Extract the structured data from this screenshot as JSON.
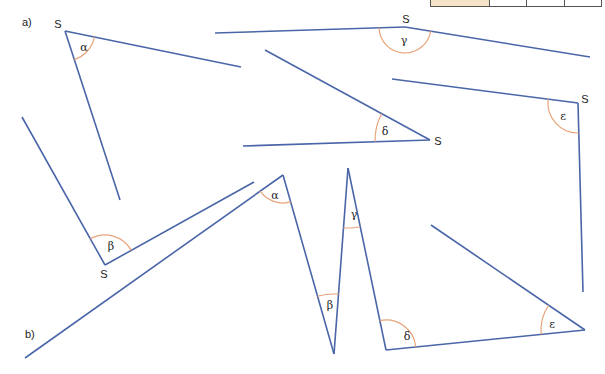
{
  "colors": {
    "line": "#4a66a8",
    "arc": "#e8a37a",
    "text": "#222222"
  },
  "top_table": {
    "cells": 4
  },
  "section_a": {
    "label": "a)",
    "angles": [
      {
        "name": "alpha",
        "symbol": "α",
        "vertex_label": "S",
        "vertex": [
          65,
          31
        ],
        "arm1": [
          241,
          67
        ],
        "arm2": [
          120,
          200
        ],
        "arc_r": 30,
        "symbol_pos": [
          84,
          47
        ],
        "vertex_label_pos": [
          58,
          24
        ]
      },
      {
        "name": "beta",
        "symbol": "β",
        "vertex_label": "S",
        "vertex": [
          105,
          265
        ],
        "arm1": [
          22,
          117
        ],
        "arm2": [
          254,
          182
        ],
        "arc_r": 30,
        "symbol_pos": [
          111,
          246
        ],
        "vertex_label_pos": [
          104,
          274
        ]
      },
      {
        "name": "gamma",
        "symbol": "γ",
        "vertex_label": "S",
        "vertex": [
          405,
          27
        ],
        "arm1": [
          215,
          33
        ],
        "arm2": [
          590,
          57
        ],
        "arc_r": 26,
        "symbol_pos": [
          404,
          40
        ],
        "vertex_label_pos": [
          406,
          19
        ]
      },
      {
        "name": "delta",
        "symbol": "δ",
        "vertex_label": "S",
        "vertex": [
          430,
          140
        ],
        "arm1": [
          265,
          50
        ],
        "arm2": [
          243,
          146
        ],
        "arc_r": 55,
        "symbol_pos": [
          385,
          131
        ],
        "vertex_label_pos": [
          438,
          141
        ]
      },
      {
        "name": "epsilon",
        "symbol": "ε",
        "vertex_label": "S",
        "vertex": [
          578,
          103
        ],
        "arm1": [
          392,
          79
        ],
        "arm2": [
          583,
          292
        ],
        "arc_r": 30,
        "symbol_pos": [
          563,
          116
        ],
        "vertex_label_pos": [
          585,
          99
        ]
      }
    ]
  },
  "section_b": {
    "label": "b)",
    "polyline": [
      [
        25,
        358
      ],
      [
        283,
        175
      ],
      [
        334,
        354
      ],
      [
        348,
        168
      ],
      [
        386,
        350
      ],
      [
        585,
        330
      ],
      [
        431,
        225
      ]
    ],
    "angles": [
      {
        "name": "alpha",
        "symbol": "α",
        "vertex": [
          283,
          175
        ],
        "arc_r": 28,
        "symbol_pos": [
          275,
          195
        ]
      },
      {
        "name": "beta",
        "symbol": "β",
        "vertex": [
          334,
          354
        ],
        "arc_r": 60,
        "symbol_pos": [
          330,
          305
        ]
      },
      {
        "name": "gamma",
        "symbol": "γ",
        "vertex": [
          348,
          168
        ],
        "arc_r": 60,
        "symbol_pos": [
          354,
          214
        ]
      },
      {
        "name": "delta",
        "symbol": "δ",
        "vertex": [
          386,
          350
        ],
        "arc_r": 30,
        "symbol_pos": [
          407,
          336
        ]
      },
      {
        "name": "epsilon",
        "symbol": "ε",
        "vertex": [
          585,
          330
        ],
        "arc_r": 44,
        "symbol_pos": [
          552,
          324
        ]
      }
    ]
  }
}
